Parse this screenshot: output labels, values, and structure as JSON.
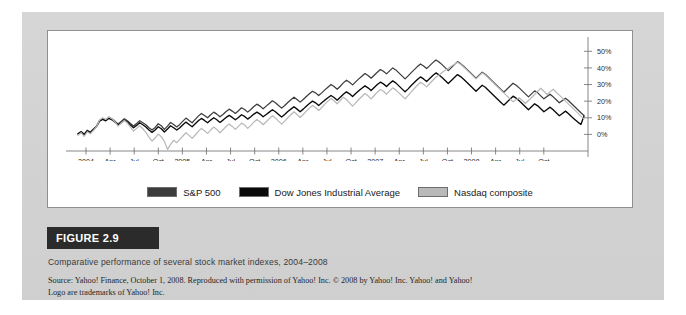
{
  "figure": {
    "tag": "FIGURE 2.9",
    "caption": "Comparative performance of several stock market indexes, 2004–2008",
    "source_line1": "Source: Yahoo! Finance, October 1, 2008. Reproduced with permission of Yahoo! Inc. © 2008 by Yahoo! Inc. Yahoo! and Yahoo!",
    "source_line2": "Logo are trademarks of Yahoo! Inc."
  },
  "legend": {
    "items": [
      {
        "label": "S&P 500",
        "color": "#3d3d3d"
      },
      {
        "label": "Dow Jones Industrial Average",
        "color": "#0a0a0a"
      },
      {
        "label": "Nasdaq composite",
        "color": "#b9b9b9"
      }
    ]
  },
  "chart_data": {
    "type": "line",
    "title": "Comparative performance of several stock market indexes, 2004–2008",
    "xlabel": "",
    "ylabel": "",
    "grid": false,
    "legend_position": "bottom",
    "yaxis_position": "right",
    "ylim": [
      -10,
      55
    ],
    "yticks": [
      0,
      10,
      20,
      30,
      40,
      50
    ],
    "ytick_labels": [
      "0%",
      "10%",
      "20%",
      "30%",
      "40%",
      "50%"
    ],
    "xtick_labels": [
      "2004",
      "Apr",
      "Jul",
      "Oct",
      "2005",
      "Apr",
      "Jul",
      "Oct",
      "2006",
      "Apr",
      "Jul",
      "Oct",
      "2007",
      "Apr",
      "Jul",
      "Oct",
      "2008",
      "Apr",
      "Jul",
      "Oct"
    ],
    "x_start": 0,
    "x_end": 58,
    "series": [
      {
        "name": "S&P 500",
        "color": "#3d3d3d",
        "width": 1.25,
        "values": [
          0.5,
          1.8,
          0.2,
          2.5,
          1.4,
          3.2,
          5.0,
          8.5,
          9.5,
          8.8,
          10.2,
          9.4,
          8.0,
          6.2,
          7.8,
          9.4,
          8.2,
          6.5,
          5.0,
          6.6,
          8.2,
          7.0,
          5.8,
          4.0,
          2.6,
          4.2,
          6.4,
          5.2,
          3.0,
          5.0,
          7.2,
          6.0,
          4.5,
          6.0,
          8.0,
          9.8,
          8.4,
          7.0,
          9.0,
          11.0,
          12.6,
          11.4,
          10.0,
          11.8,
          13.4,
          12.2,
          10.6,
          12.0,
          13.8,
          15.2,
          14.0,
          12.6,
          14.2,
          16.0,
          15.0,
          13.4,
          15.0,
          16.8,
          18.2,
          17.0,
          15.4,
          17.0,
          18.6,
          20.2,
          19.0,
          17.4,
          15.8,
          17.4,
          19.2,
          20.8,
          22.4,
          21.0,
          19.4,
          21.0,
          22.8,
          24.4,
          26.0,
          25.0,
          23.4,
          25.0,
          26.8,
          28.4,
          30.0,
          28.8,
          27.2,
          29.0,
          31.0,
          32.6,
          31.4,
          29.8,
          31.6,
          33.4,
          35.0,
          36.6,
          35.4,
          33.8,
          35.6,
          37.4,
          39.0,
          38.0,
          36.4,
          38.2,
          40.0,
          38.8,
          37.0,
          35.2,
          33.4,
          35.2,
          37.2,
          39.0,
          40.8,
          42.4,
          41.2,
          39.6,
          41.4,
          43.2,
          44.8,
          43.6,
          42.0,
          40.2,
          38.4,
          40.2,
          42.0,
          43.8,
          42.6,
          41.0,
          39.2,
          37.4,
          35.6,
          33.8,
          35.6,
          37.4,
          36.2,
          34.4,
          32.6,
          30.8,
          29.0,
          27.2,
          25.4,
          27.2,
          29.0,
          30.8,
          29.6,
          28.0,
          26.2,
          24.4,
          22.6,
          24.4,
          26.2,
          25.0,
          23.2,
          21.4,
          22.8,
          24.2,
          22.6,
          20.8,
          19.0,
          20.4,
          21.8,
          20.2,
          18.4,
          16.6,
          14.8,
          13.0,
          11.4
        ],
        "smooth": true
      },
      {
        "name": "Dow Jones Industrial Average",
        "color": "#0a0a0a",
        "width": 1.35,
        "values": [
          0.2,
          1.4,
          -0.2,
          2.0,
          1.0,
          2.8,
          4.6,
          8.0,
          9.0,
          8.2,
          9.6,
          8.8,
          7.4,
          5.6,
          7.0,
          8.6,
          7.4,
          5.6,
          4.0,
          5.4,
          7.0,
          5.8,
          4.4,
          2.6,
          1.2,
          2.6,
          4.6,
          3.4,
          1.4,
          3.2,
          5.2,
          4.0,
          2.6,
          4.0,
          5.8,
          7.4,
          6.0,
          4.6,
          6.4,
          8.2,
          9.6,
          8.4,
          7.0,
          8.6,
          10.0,
          8.8,
          7.2,
          8.6,
          10.2,
          11.4,
          10.2,
          8.8,
          10.2,
          11.8,
          10.8,
          9.2,
          10.6,
          12.2,
          13.4,
          12.2,
          10.6,
          12.0,
          13.4,
          14.8,
          13.6,
          12.0,
          10.4,
          12.0,
          13.8,
          15.2,
          16.6,
          15.2,
          13.6,
          15.2,
          17.0,
          18.6,
          20.0,
          19.0,
          17.4,
          19.0,
          20.6,
          22.0,
          23.4,
          22.2,
          20.6,
          22.4,
          24.2,
          25.6,
          24.4,
          22.8,
          24.6,
          26.2,
          27.8,
          29.2,
          28.0,
          26.4,
          28.2,
          30.0,
          31.4,
          30.4,
          28.8,
          30.6,
          32.2,
          31.0,
          29.2,
          27.4,
          25.6,
          27.4,
          29.4,
          31.2,
          33.0,
          34.6,
          33.4,
          31.8,
          33.6,
          35.4,
          37.0,
          35.8,
          34.2,
          32.4,
          30.6,
          32.4,
          34.2,
          36.0,
          34.8,
          33.2,
          31.4,
          29.6,
          27.8,
          26.0,
          27.8,
          29.6,
          28.4,
          26.6,
          24.8,
          23.0,
          21.2,
          19.4,
          17.6,
          19.4,
          21.2,
          23.0,
          21.8,
          20.2,
          18.4,
          16.6,
          14.8,
          16.6,
          18.4,
          17.2,
          15.4,
          13.6,
          15.0,
          16.4,
          14.8,
          13.0,
          11.2,
          12.6,
          14.0,
          12.4,
          10.6,
          9.0,
          7.4,
          6.0,
          11.0
        ],
        "smooth": true
      },
      {
        "name": "Nasdaq composite",
        "color": "#b9b9b9",
        "width": 1.25,
        "values": [
          -0.5,
          1.0,
          -1.2,
          1.6,
          0.4,
          2.4,
          4.6,
          8.6,
          10.0,
          9.0,
          10.6,
          9.4,
          7.6,
          5.0,
          6.8,
          8.4,
          6.8,
          4.4,
          2.0,
          3.6,
          5.2,
          3.4,
          1.2,
          -1.6,
          -4.0,
          -2.2,
          0.2,
          -1.4,
          -4.2,
          -9.0,
          -6.0,
          -3.6,
          -5.0,
          -3.0,
          -1.0,
          1.0,
          -0.6,
          -2.4,
          -0.4,
          1.8,
          3.6,
          2.2,
          0.6,
          2.6,
          4.4,
          3.0,
          1.0,
          2.8,
          4.8,
          6.2,
          4.8,
          3.0,
          4.8,
          6.8,
          5.6,
          3.6,
          5.4,
          7.4,
          9.0,
          7.6,
          5.8,
          7.6,
          9.4,
          11.2,
          9.8,
          8.0,
          6.2,
          8.0,
          10.0,
          11.8,
          13.6,
          12.0,
          10.2,
          12.0,
          14.0,
          15.8,
          17.4,
          16.2,
          14.4,
          16.2,
          18.2,
          20.0,
          21.6,
          20.2,
          18.4,
          20.4,
          22.4,
          21.0,
          19.0,
          17.0,
          19.0,
          21.0,
          22.8,
          24.6,
          23.2,
          21.4,
          23.4,
          25.4,
          27.0,
          26.0,
          24.2,
          26.2,
          28.0,
          26.8,
          25.0,
          23.2,
          21.4,
          23.4,
          25.6,
          27.6,
          29.6,
          31.4,
          30.2,
          28.6,
          30.6,
          32.6,
          34.4,
          35.8,
          37.2,
          38.6,
          39.8,
          41.0,
          42.2,
          43.4,
          42.2,
          40.6,
          38.8,
          37.0,
          35.2,
          33.4,
          35.2,
          37.0,
          35.8,
          34.0,
          32.2,
          30.4,
          28.6,
          26.8,
          25.0,
          23.2,
          21.4,
          19.6,
          20.8,
          22.0,
          20.4,
          18.6,
          20.4,
          22.2,
          24.0,
          26.0,
          27.8,
          26.0,
          24.0,
          25.6,
          27.2,
          25.4,
          23.6,
          21.8,
          20.0,
          18.2,
          16.4,
          14.6,
          12.8,
          11.0,
          9.4
        ],
        "smooth": true
      }
    ]
  }
}
